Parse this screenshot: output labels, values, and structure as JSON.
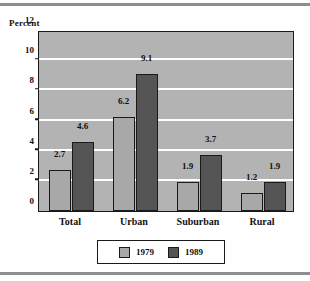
{
  "chart_data": {
    "type": "bar",
    "title": "",
    "subtitle": "",
    "xlabel": "",
    "ylabel": "Percent",
    "categories": [
      "Total",
      "Urban",
      "Suburban",
      "Rural"
    ],
    "series": [
      {
        "name": "1979",
        "values": [
          2.7,
          6.2,
          1.9,
          1.2
        ],
        "color": "#a8a8a8"
      },
      {
        "name": "1989",
        "values": [
          4.6,
          9.1,
          3.7,
          1.9
        ],
        "color": "#555555"
      }
    ],
    "ylim": [
      0,
      12
    ],
    "yticks": [
      "0",
      "2",
      "4",
      "6",
      "8",
      "10",
      "12"
    ],
    "ytick_values": [
      0,
      2,
      4,
      6,
      8,
      10,
      12
    ],
    "gridlines": [
      2,
      4,
      6,
      8,
      10
    ],
    "grid": true,
    "legend_position": "bottom",
    "data_labels": [
      [
        "2.7",
        "4.6"
      ],
      [
        "6.2",
        "9.1"
      ],
      [
        "1.9",
        "3.7"
      ],
      [
        "1.2",
        "1.9"
      ]
    ],
    "plot_background": "#b3b3b3",
    "gridline_color": "#ffffff",
    "axis_color": "#1a1a1a"
  }
}
